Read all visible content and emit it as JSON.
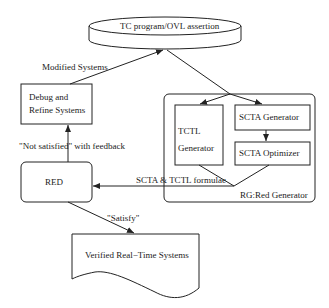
{
  "nodes": {
    "tc_program": {
      "label": "TC program/OVL assertion",
      "shape": "cylinder"
    },
    "debug": {
      "line1": "Debug and",
      "line2": "Refine Systems",
      "shape": "rectangle"
    },
    "red": {
      "label": "RED",
      "shape": "rounded-rectangle"
    },
    "rg_group": {
      "label": "RG:Red Generator",
      "shape": "rounded-rectangle"
    },
    "tctl_gen": {
      "line1": "TCTL",
      "line2": "Generator",
      "shape": "rectangle"
    },
    "scta_gen": {
      "label": "SCTA Generator",
      "shape": "rectangle"
    },
    "scta_opt": {
      "label": "SCTA Optimizer",
      "shape": "rectangle"
    },
    "verified": {
      "label": "Verified Real−Time Systems",
      "shape": "document"
    }
  },
  "edges": {
    "modified": {
      "label": "Modified  Systems",
      "from": "debug",
      "to": "tc_program"
    },
    "not_satisfied": {
      "label": "\"Not satisfied\" with feedback",
      "from": "red",
      "to": "debug"
    },
    "scta_tctl": {
      "label": "SCTA &  TCTL formulae",
      "from": "rg_group",
      "to": "red"
    },
    "satisfy": {
      "label": "\"Satisfy\"",
      "from": "red",
      "to": "verified"
    },
    "tc_to_rg": {
      "label": "",
      "from": "tc_program",
      "to": "rg_group"
    }
  },
  "colors": {
    "stroke": "#222222",
    "background": "#ffffff"
  }
}
